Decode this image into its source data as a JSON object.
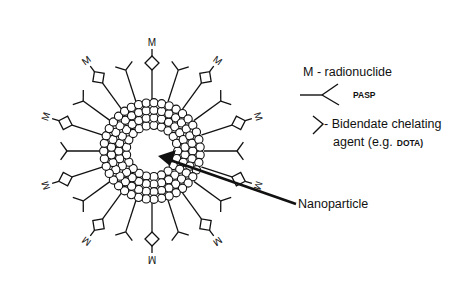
{
  "diagram": {
    "center": {
      "x": 152,
      "y": 151
    },
    "nanoparticle": {
      "outer_radius": 52,
      "inner_radius": 22,
      "bead_rows": 4,
      "label": "Nanoparticle",
      "arrow": {
        "from": {
          "x": 296,
          "y": 204
        },
        "to": {
          "x": 160,
          "y": 156
        }
      }
    },
    "spokes": [
      {
        "angle_deg": -90,
        "type": "chelator-M",
        "length": 95
      },
      {
        "angle_deg": -72,
        "type": "pasp",
        "length": 85
      },
      {
        "angle_deg": -54,
        "type": "chelator-M",
        "length": 98
      },
      {
        "angle_deg": -36,
        "type": "pasp",
        "length": 85
      },
      {
        "angle_deg": -18,
        "type": "chelator-M",
        "length": 98
      },
      {
        "angle_deg": 0,
        "type": "pasp",
        "length": 85
      },
      {
        "angle_deg": 18,
        "type": "chelator-M",
        "length": 98
      },
      {
        "angle_deg": 36,
        "type": "pasp",
        "length": 85
      },
      {
        "angle_deg": 54,
        "type": "chelator-M",
        "length": 98
      },
      {
        "angle_deg": 72,
        "type": "pasp",
        "length": 85
      },
      {
        "angle_deg": 90,
        "type": "chelator-M",
        "length": 95
      },
      {
        "angle_deg": 108,
        "type": "pasp",
        "length": 85
      },
      {
        "angle_deg": 126,
        "type": "chelator-M",
        "length": 98
      },
      {
        "angle_deg": 144,
        "type": "pasp",
        "length": 85
      },
      {
        "angle_deg": 162,
        "type": "chelator-M",
        "length": 98
      },
      {
        "angle_deg": 180,
        "type": "pasp",
        "length": 85
      },
      {
        "angle_deg": 198,
        "type": "chelator-M",
        "length": 98
      },
      {
        "angle_deg": 216,
        "type": "pasp",
        "length": 85
      },
      {
        "angle_deg": 234,
        "type": "chelator-M",
        "length": 98
      },
      {
        "angle_deg": 252,
        "type": "pasp",
        "length": 85
      }
    ],
    "metal_label": "M"
  },
  "legend": {
    "radionuclide": "M - radionuclide",
    "pasp": "PASP",
    "chelator_line1": "- Bidendate chelating",
    "chelator_line2_prefix": "agent (e.g.",
    "chelator_line2_bold": "DOTA)"
  },
  "colors": {
    "stroke": "#111111",
    "background": "#ffffff",
    "bead_fill": "#ffffff"
  }
}
